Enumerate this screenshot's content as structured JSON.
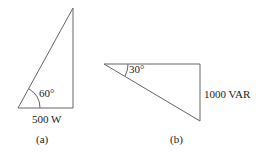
{
  "figure_a": {
    "angle_label": "60°",
    "base_label": "500 W",
    "caption": "(a)"
  },
  "figure_b": {
    "angle_label": "30°",
    "side_label": "1000 VAR",
    "caption": "(b)"
  },
  "colors": {
    "line": "#555555",
    "text": "#222222"
  }
}
